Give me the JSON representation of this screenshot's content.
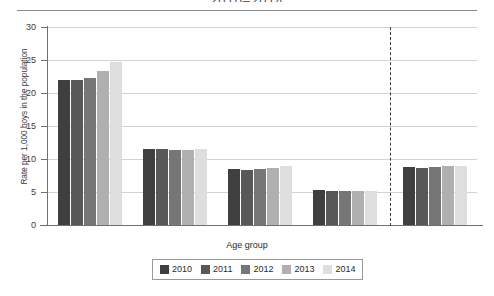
{
  "title": "2010–2014",
  "axis": {
    "xlabel": "Age group",
    "ylabel": "Rate per 1,000 boys in the population",
    "yticks": [
      "0",
      "5",
      "10",
      "15",
      "20",
      "25",
      "30"
    ]
  },
  "legend": {
    "items": [
      {
        "label": "2010",
        "color": "#3f3f3f"
      },
      {
        "label": "2011",
        "color": "#585858"
      },
      {
        "label": "2012",
        "color": "#767676"
      },
      {
        "label": "2013",
        "color": "#b0b0b0"
      },
      {
        "label": "2014",
        "color": "#dedede"
      }
    ]
  },
  "categories": [
    {
      "label": "<1",
      "first_value": "21.9",
      "last_value": "24.7"
    },
    {
      "label": "1–5",
      "first_value": "11.5",
      "last_value": "11.5"
    },
    {
      "label": "6–10",
      "first_value": "8.5",
      "last_value": "8.9"
    },
    {
      "label": "11–17",
      "first_value": "5.3",
      "last_value": "5.2"
    },
    {
      "label": "<1–17",
      "first_value": "8.8",
      "last_value": "9.0"
    }
  ],
  "chart_data": {
    "type": "bar",
    "title": "2010–2014",
    "xlabel": "Age group",
    "ylabel": "Rate per 1,000 boys in the population",
    "categories": [
      "<1",
      "1–5",
      "6–10",
      "11–17",
      "<1–17"
    ],
    "ylim": [
      0,
      30
    ],
    "yticks": [
      0,
      5,
      10,
      15,
      20,
      25,
      30
    ],
    "grid": "horizontal",
    "legend_position": "bottom",
    "annotations": [
      "dashed vertical separator before the <1–17 total group"
    ],
    "series": [
      {
        "name": "2010",
        "color": "#3f3f3f",
        "values": [
          21.9,
          11.5,
          8.5,
          5.3,
          8.8
        ]
      },
      {
        "name": "2011",
        "color": "#585858",
        "values": [
          21.9,
          11.5,
          8.4,
          5.2,
          8.7
        ]
      },
      {
        "name": "2012",
        "color": "#767676",
        "values": [
          22.2,
          11.4,
          8.5,
          5.2,
          8.8
        ]
      },
      {
        "name": "2013",
        "color": "#b0b0b0",
        "values": [
          23.4,
          11.4,
          8.6,
          5.1,
          8.9
        ]
      },
      {
        "name": "2014",
        "color": "#dedede",
        "values": [
          24.7,
          11.5,
          8.9,
          5.2,
          9.0
        ]
      }
    ],
    "data_labels": {
      "shown_for": [
        "first series",
        "last series"
      ],
      "values": [
        {
          "category": "<1",
          "2010": "21.9",
          "2014": "24.7"
        },
        {
          "category": "1–5",
          "2010": "11.5",
          "2014": "11.5"
        },
        {
          "category": "6–10",
          "2010": "8.5",
          "2014": "8.9"
        },
        {
          "category": "11–17",
          "2010": "5.3",
          "2014": "5.2"
        },
        {
          "category": "<1–17",
          "2010": "8.8",
          "2014": "9.0"
        }
      ]
    }
  }
}
